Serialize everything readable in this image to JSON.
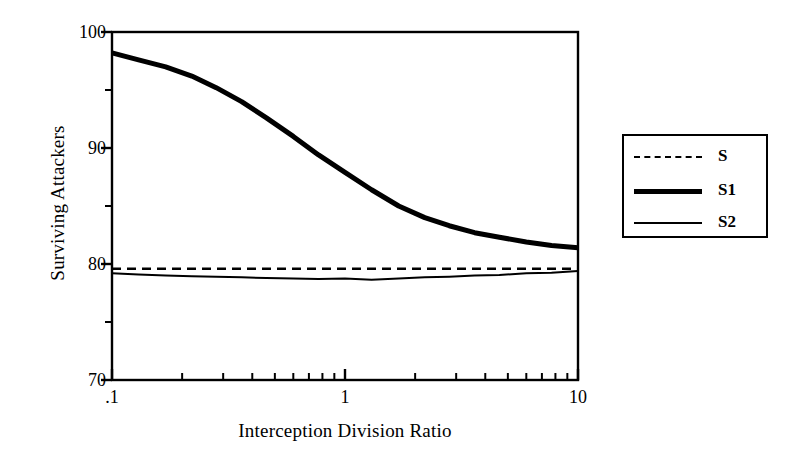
{
  "chart_data": {
    "type": "line",
    "title": "",
    "xlabel": "Interception Division Ratio",
    "ylabel": "Surviving Attackers",
    "xscale": "log",
    "xlim": [
      0.1,
      10
    ],
    "ylim": [
      70,
      100
    ],
    "grid": false,
    "legend_position": "right-outside",
    "xticks": [
      0.1,
      1,
      10
    ],
    "xtick_labels": [
      ".1",
      "1",
      "10"
    ],
    "xminor_ticks": [
      0.2,
      0.3,
      0.4,
      0.5,
      0.6,
      0.7,
      0.8,
      0.9,
      2,
      3,
      4,
      5,
      6,
      7,
      8,
      9
    ],
    "yticks": [
      70,
      80,
      90,
      100
    ],
    "ytick_labels": [
      "70",
      "80",
      "90",
      "100"
    ],
    "yminor_ticks": [
      75,
      85,
      95
    ],
    "x": [
      0.1,
      0.13,
      0.17,
      0.22,
      0.28,
      0.36,
      0.46,
      0.6,
      0.77,
      1.0,
      1.3,
      1.7,
      2.2,
      2.8,
      3.6,
      4.6,
      6.0,
      7.7,
      10.0
    ],
    "series": [
      {
        "name": "S",
        "style": "dashed",
        "width": 2.5,
        "color": "#000000",
        "values": [
          79.6,
          79.6,
          79.6,
          79.6,
          79.6,
          79.6,
          79.6,
          79.6,
          79.6,
          79.6,
          79.6,
          79.6,
          79.6,
          79.6,
          79.6,
          79.6,
          79.6,
          79.6,
          79.6
        ]
      },
      {
        "name": "S1",
        "style": "solid",
        "width": 5,
        "color": "#000000",
        "values": [
          98.2,
          97.6,
          97.0,
          96.2,
          95.2,
          94.0,
          92.6,
          91.0,
          89.4,
          87.9,
          86.4,
          85.0,
          84.0,
          83.3,
          82.7,
          82.3,
          81.9,
          81.6,
          81.4
        ]
      },
      {
        "name": "S2",
        "style": "solid",
        "width": 2,
        "color": "#000000",
        "values": [
          79.2,
          79.1,
          79.0,
          78.95,
          78.9,
          78.85,
          78.8,
          78.75,
          78.7,
          78.75,
          78.65,
          78.75,
          78.85,
          78.9,
          79.0,
          79.05,
          79.2,
          79.25,
          79.4
        ]
      }
    ]
  },
  "legend": {
    "entries": [
      {
        "label": "S",
        "style": "dashed"
      },
      {
        "label": "S1",
        "style": "thick"
      },
      {
        "label": "S2",
        "style": "thin"
      }
    ]
  },
  "axes": {
    "y_title": "Surviving Attackers",
    "x_title": "Interception Division Ratio"
  }
}
